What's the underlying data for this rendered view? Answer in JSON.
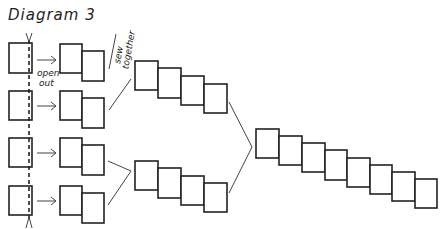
{
  "diagram": {
    "title": "Diagram 3",
    "labels": {
      "open_out_line1": "open",
      "open_out_line2": "out",
      "sew_together_line1": "sew",
      "sew_together_line2": "together"
    },
    "stages": [
      {
        "name": "single-pieces",
        "count": 4
      },
      {
        "name": "opened-pairs",
        "count": 4,
        "boxes_each": 2
      },
      {
        "name": "sewn-groups",
        "count": 2,
        "boxes_each": 4
      },
      {
        "name": "final-strip",
        "count": 1,
        "boxes_each": 8
      }
    ],
    "colors": {
      "stroke": "#222222",
      "background": "#ffffff"
    }
  }
}
